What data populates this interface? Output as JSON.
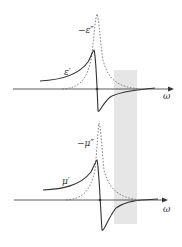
{
  "figure": {
    "colors": {
      "curve": "#333333",
      "dashed": "#777777",
      "axis": "#333333",
      "band": "#e6e6e6"
    },
    "panels": [
      {
        "id": "permittivity",
        "solid_label": "ε′",
        "dashed_label": "−ε″",
        "axis_label": "ω"
      },
      {
        "id": "permeability",
        "solid_label": "μ′",
        "dashed_label": "−μ″",
        "axis_label": "ω"
      }
    ]
  }
}
